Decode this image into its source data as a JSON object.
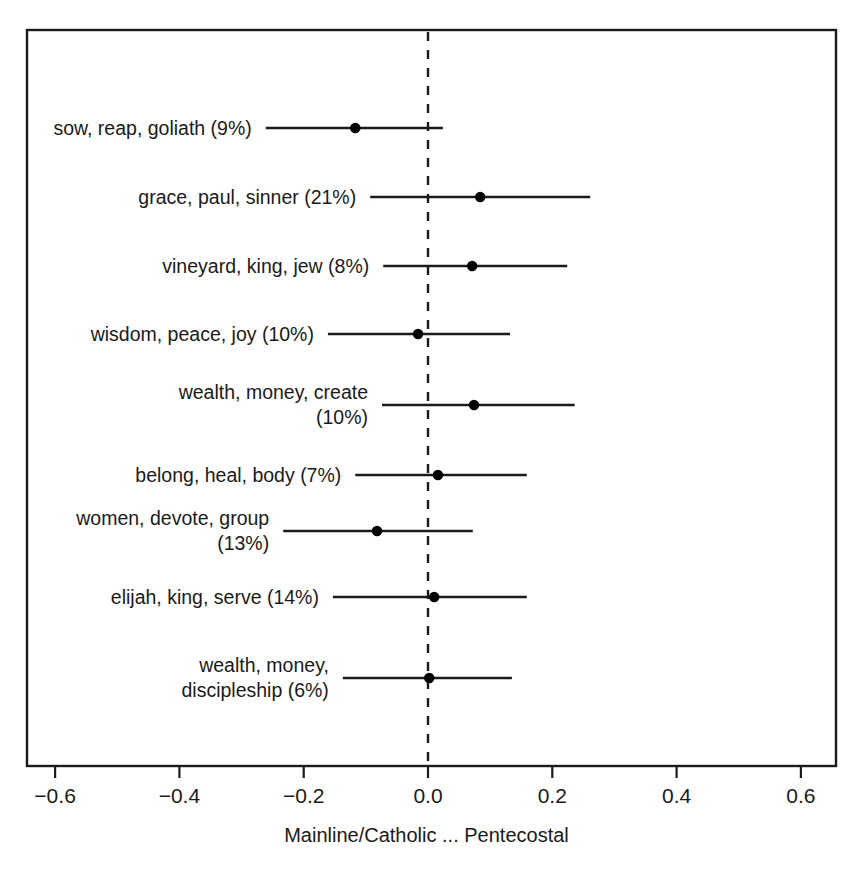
{
  "chart_data": {
    "type": "scatter",
    "title": "",
    "xlabel": "Mainline/Catholic ... Pentecostal",
    "ylabel": "",
    "xlim": [
      -0.72,
      0.72
    ],
    "xticks": [
      -0.6,
      -0.4,
      -0.2,
      0.0,
      0.2,
      0.4,
      0.6
    ],
    "xticklabels": [
      "−0.6",
      "−0.4",
      "−0.2",
      "0.0",
      "0.2",
      "0.4",
      "0.6"
    ],
    "grid": false,
    "legend": null,
    "reference_line": {
      "x": 0.0,
      "style": "dashed"
    },
    "categories": [
      "sow, reap, goliath (9%)",
      "grace, paul, sinner (21%)",
      "vineyard, king, jew (8%)",
      "wisdom, peace, joy (10%)",
      "wealth, money, create\n(10%)",
      "belong, heal, body (7%)",
      "women, devote, group\n(13%)",
      "elijah, king, serve (14%)",
      "wealth, money,\ndiscipleship (6%)"
    ],
    "values": [
      -0.117,
      0.084,
      0.071,
      -0.016,
      0.074,
      0.016,
      -0.082,
      0.01,
      0.002
    ],
    "ci_low": [
      -0.261,
      -0.093,
      -0.072,
      -0.161,
      -0.074,
      -0.117,
      -0.233,
      -0.153,
      -0.137
    ],
    "ci_high": [
      0.024,
      0.261,
      0.224,
      0.132,
      0.236,
      0.159,
      0.072,
      0.159,
      0.135
    ],
    "point_color": "#000000",
    "line_color": "#1a1a1a",
    "frame_color": "#1a1a1a"
  }
}
